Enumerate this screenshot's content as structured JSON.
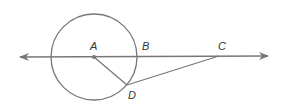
{
  "diagram": {
    "type": "geometry",
    "colors": {
      "stroke": "#777777",
      "label": "#333333",
      "background": "#ffffff"
    },
    "circle": {
      "center": "A",
      "cx": 94,
      "cy": 57,
      "r": 43
    },
    "points": [
      {
        "name": "A",
        "x": 94,
        "y": 57,
        "label": "A",
        "label_x": 90,
        "label_y": 50
      },
      {
        "name": "B",
        "x": 137,
        "y": 57,
        "label": "B",
        "label_x": 142,
        "label_y": 50
      },
      {
        "name": "C",
        "x": 219,
        "y": 56,
        "label": "C",
        "label_x": 218,
        "label_y": 50
      },
      {
        "name": "D",
        "x": 127,
        "y": 85,
        "label": "D",
        "label_x": 128,
        "label_y": 98
      }
    ],
    "line": {
      "x1": 20,
      "y1": 57,
      "x2": 268,
      "y2": 56,
      "arrows": "both"
    },
    "segments": [
      "AD",
      "DC"
    ]
  }
}
